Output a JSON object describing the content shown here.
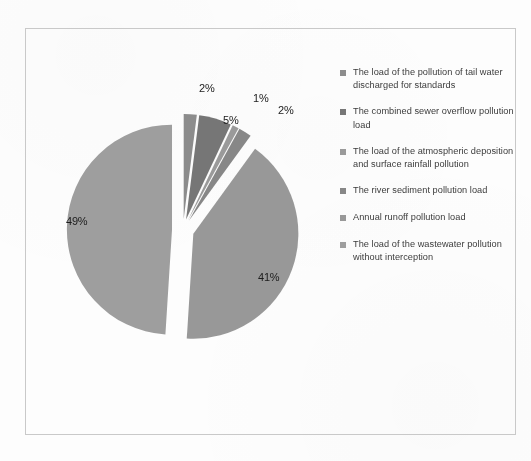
{
  "chart_data": {
    "type": "pie",
    "title": "",
    "subtitle": "",
    "xlabel": "",
    "ylabel": "",
    "legend_position": "right",
    "grid": false,
    "exploded": true,
    "start_angle_deg": 0,
    "direction": "clockwise",
    "value_unit": "%",
    "categories": [
      "The load of the pollution of tail water discharged for standards",
      "The combined sewer overflow pollution load",
      "The load of the atmospheric deposition and surface rainfall pollution",
      "The river sediment pollution load",
      "Annual runoff pollution load",
      "The load of the wastewater pollution without interception"
    ],
    "values": [
      2,
      5,
      1,
      2,
      41,
      49
    ],
    "data_labels": [
      "2%",
      "5%",
      "1%",
      "2%",
      "41%",
      "49%"
    ],
    "colors": [
      "#8c8c8c",
      "#767676",
      "#9a9a9a",
      "#878787",
      "#989898",
      "#9e9e9e"
    ],
    "total": 100
  },
  "legend": {
    "items": [
      {
        "label": "The load of the pollution of tail water discharged for standards",
        "marker_color": "#8c8c8c",
        "value": 2
      },
      {
        "label": "The combined sewer overflow pollution load",
        "marker_color": "#767676",
        "value": 5
      },
      {
        "label": "The load of the atmospheric deposition and surface rainfall pollution",
        "marker_color": "#9a9a9a",
        "value": 1
      },
      {
        "label": "The river sediment pollution load",
        "marker_color": "#878787",
        "value": 2
      },
      {
        "label": "Annual runoff pollution load",
        "marker_color": "#989898",
        "value": 41
      },
      {
        "label": "The load of the wastewater pollution without interception",
        "marker_color": "#9e9e9e",
        "value": 49
      }
    ]
  },
  "slice_labels": [
    {
      "text": "2%",
      "left": 174,
      "top": 54
    },
    {
      "text": "5%",
      "left": 198,
      "top": 86
    },
    {
      "text": "1%",
      "left": 228,
      "top": 64
    },
    {
      "text": "2%",
      "left": 253,
      "top": 76
    },
    {
      "text": "41%",
      "left": 233,
      "top": 243
    },
    {
      "text": "49%",
      "left": 41,
      "top": 187
    }
  ],
  "colors": {
    "frame_border": "#c9c9c9",
    "background": "#fdfdfd",
    "label_text": "#1c1c1c",
    "legend_text": "#3b3b3b"
  }
}
